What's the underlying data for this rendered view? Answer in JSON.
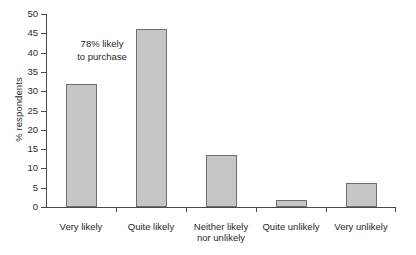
{
  "chart_data": {
    "type": "bar",
    "title": "",
    "xlabel": "",
    "ylabel": "% respondents",
    "ylim": [
      0,
      50
    ],
    "yticks": [
      0,
      5,
      10,
      15,
      20,
      25,
      30,
      35,
      40,
      45,
      50
    ],
    "grid": false,
    "legend": null,
    "categories": [
      "Very likely",
      "Quite likely",
      "Neither likely\nnor unlikely",
      "Quite unlikely",
      "Very unlikely"
    ],
    "values": [
      31.8,
      46.2,
      13.4,
      1.8,
      6.3
    ],
    "annotations": [
      {
        "text": "78% likely\nto purchase",
        "near_categories": [
          "Very likely",
          "Quite likely"
        ],
        "value": 78
      }
    ],
    "bar_fill_color": "#c6c6c6",
    "bar_edge_color": "#6f6f6f",
    "axis_color": "#4a4a4a",
    "background_color": "#ffffff"
  },
  "figure": {
    "caption": ""
  }
}
